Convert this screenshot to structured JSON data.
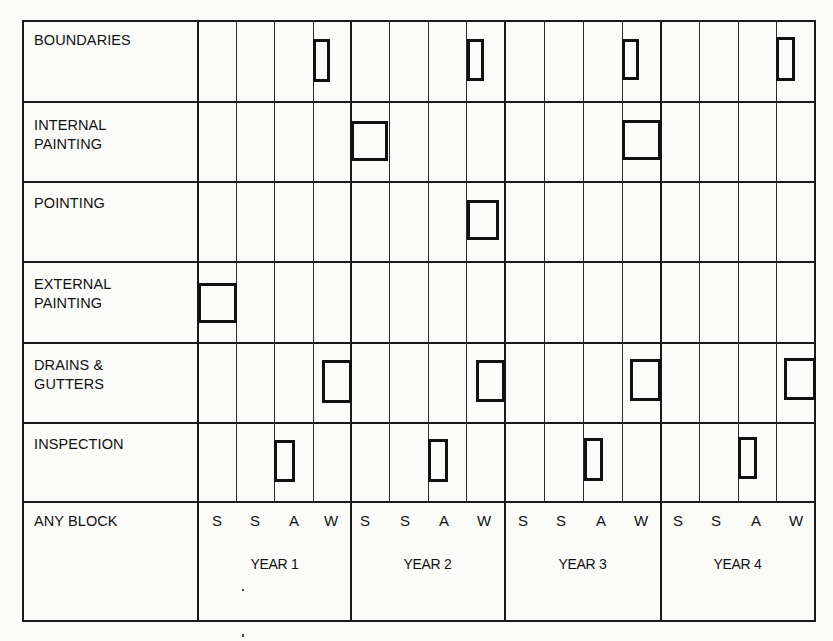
{
  "rows": [
    {
      "label": "BOUNDARIES"
    },
    {
      "label": "INTERNAL\nPAINTING"
    },
    {
      "label": "POINTING"
    },
    {
      "label": "EXTERNAL\nPAINTING"
    },
    {
      "label": "DRAINS &\nGUTTERS"
    },
    {
      "label": "INSPECTION"
    },
    {
      "label": "ANY BLOCK"
    }
  ],
  "seasons": [
    "S",
    "S",
    "A",
    "W",
    "S",
    "S",
    "A",
    "W",
    "S",
    "S",
    "A",
    "W",
    "S",
    "S",
    "A",
    "W"
  ],
  "years": [
    "YEAR 1",
    "YEAR 2",
    "YEAR 3",
    "YEAR 4"
  ],
  "schedule": {
    "BOUNDARIES": [
      "Y1-W",
      "Y2-A",
      "Y3-A",
      "Y4-A"
    ],
    "INTERNAL PAINTING": [
      "Y2-S",
      "Y3-A/W"
    ],
    "POINTING": [
      "Y2-A"
    ],
    "EXTERNAL PAINTING": [
      "Y1-S"
    ],
    "DRAINS & GUTTERS": [
      "Y1-W",
      "Y2-W",
      "Y3-W",
      "Y4-W"
    ],
    "INSPECTION": [
      "Y1-A",
      "Y2-A",
      "Y3-A",
      "Y4-A"
    ]
  },
  "colors": {
    "ink": "#111111",
    "paper": "#fbfbf9"
  }
}
